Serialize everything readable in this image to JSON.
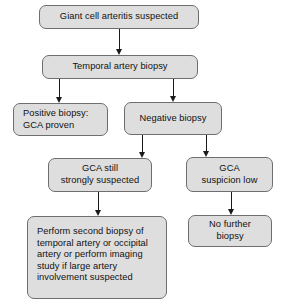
{
  "diagram": {
    "colors": {
      "node_fill": "#dedede",
      "node_border": "#6e6e6e",
      "connector": "#1a1a1a",
      "background": "#ffffff",
      "text": "#111111"
    },
    "nodes": [
      {
        "id": "gca-suspected",
        "label": "Giant cell arteritis suspected",
        "x": 39,
        "y": 5,
        "w": 160,
        "h": 24,
        "align": "center"
      },
      {
        "id": "temporal-artery-biopsy",
        "label": "Temporal artery biopsy",
        "x": 42,
        "y": 55,
        "w": 156,
        "h": 24,
        "align": "center"
      },
      {
        "id": "positive-biopsy",
        "label": "Positive biopsy:\nGCA proven",
        "x": 13,
        "y": 103,
        "w": 95,
        "h": 33,
        "align": "left"
      },
      {
        "id": "negative-biopsy",
        "label": "Negative biopsy",
        "x": 124,
        "y": 102,
        "w": 98,
        "h": 33,
        "align": "center"
      },
      {
        "id": "gca-still-strongly-suspected",
        "label": "GCA still\nstrongly suspected",
        "x": 48,
        "y": 158,
        "w": 104,
        "h": 34,
        "align": "center"
      },
      {
        "id": "gca-suspicion-low",
        "label": "GCA\nsuspicion low",
        "x": 186,
        "y": 157,
        "w": 87,
        "h": 35,
        "align": "center"
      },
      {
        "id": "perform-second-biopsy",
        "label": "Perform second biopsy of\ntemporal artery or occipital\nartery or perform imaging\nstudy if large artery\ninvolvement suspected",
        "x": 27,
        "y": 216,
        "w": 140,
        "h": 83,
        "align": "block"
      },
      {
        "id": "no-further-biopsy",
        "label": "No further\nbiopsy",
        "x": 188,
        "y": 215,
        "w": 84,
        "h": 32,
        "align": "center"
      }
    ],
    "connectors": [
      {
        "id": "arrow-suspected-to-biopsy",
        "from": "gca-suspected",
        "to": "temporal-artery-biopsy",
        "x": 119,
        "y": 29,
        "length": 26
      },
      {
        "id": "arrow-biopsy-to-positive",
        "from": "temporal-artery-biopsy",
        "to": "positive-biopsy",
        "x": 59,
        "y": 79,
        "length": 24
      },
      {
        "id": "arrow-biopsy-to-negative",
        "from": "temporal-artery-biopsy",
        "to": "negative-biopsy",
        "x": 173,
        "y": 79,
        "length": 23
      },
      {
        "id": "arrow-negative-to-still-suspected",
        "from": "negative-biopsy",
        "to": "gca-still-strongly-suspected",
        "x": 142,
        "y": 135,
        "length": 23
      },
      {
        "id": "arrow-negative-to-suspicion-low",
        "from": "negative-biopsy",
        "to": "gca-suspicion-low",
        "x": 206,
        "y": 135,
        "length": 22
      },
      {
        "id": "arrow-suspected-to-second-biopsy",
        "from": "gca-still-strongly-suspected",
        "to": "perform-second-biopsy",
        "x": 98,
        "y": 192,
        "length": 24
      },
      {
        "id": "arrow-low-to-no-further",
        "from": "gca-suspicion-low",
        "to": "no-further-biopsy",
        "x": 231,
        "y": 192,
        "length": 23
      }
    ]
  }
}
